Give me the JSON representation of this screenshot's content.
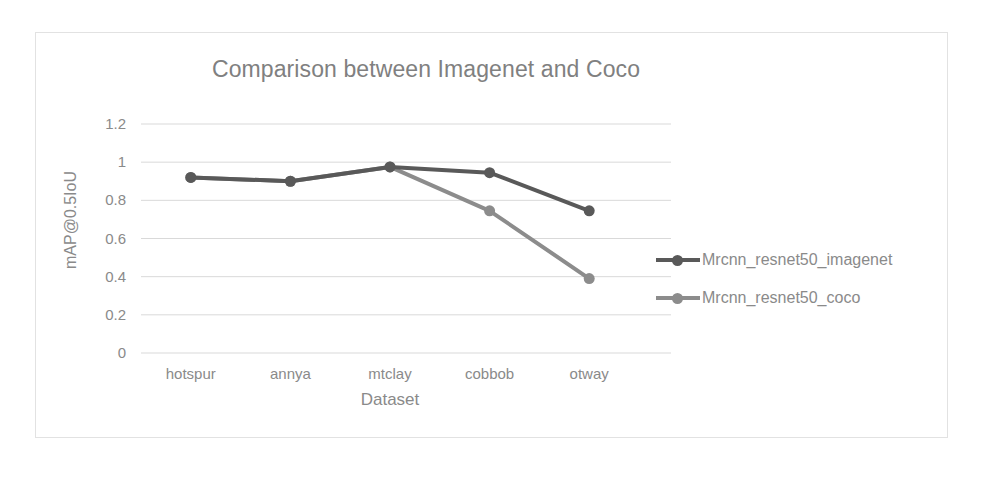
{
  "chart_data": {
    "type": "line",
    "title": "Comparison between Imagenet and Coco",
    "xlabel": "Dataset",
    "ylabel": "mAP@0.5IoU",
    "categories": [
      "hotspur",
      "annya",
      "mtclay",
      "cobbob",
      "otway"
    ],
    "series": [
      {
        "name": "Mrcnn_resnet50_imagenet",
        "color": "#595959",
        "values": [
          0.92,
          0.9,
          0.975,
          0.945,
          0.745
        ]
      },
      {
        "name": "Mrcnn_resnet50_coco",
        "color": "#8c8c8c",
        "values": [
          0.92,
          0.9,
          0.975,
          0.745,
          0.39
        ]
      }
    ],
    "ylim": [
      0,
      1.2
    ],
    "ytick_labels": [
      "1.2",
      "1",
      "0.8",
      "0.6",
      "0.4",
      "0.2",
      "0"
    ],
    "ytick_values": [
      1.2,
      1.0,
      0.8,
      0.6,
      0.4,
      0.2,
      0
    ],
    "grid": true,
    "legend_position": "right",
    "markers": "circle",
    "gridline_color": "#d9d9d9",
    "text_color": "#8a8a8a",
    "frame_color": "#e2e2e2",
    "background": "#ffffff"
  }
}
